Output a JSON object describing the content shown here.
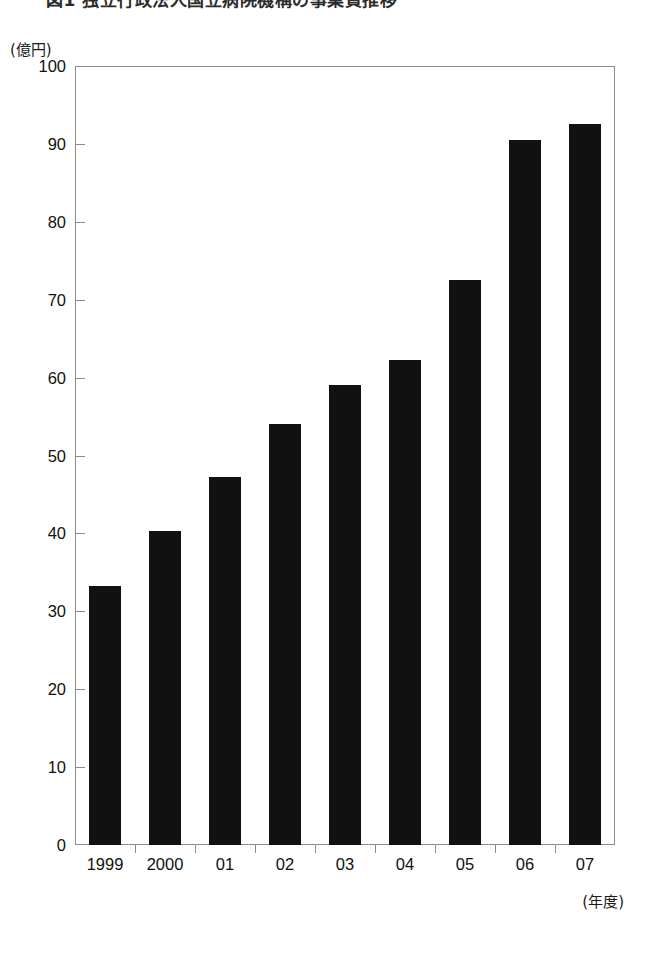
{
  "figure": {
    "title_cutoff": "図1 独立行政法人国立病院機構の事業費推移",
    "unit_label": "(億円)",
    "xaxis_caption": "(年度)"
  },
  "chart_data": {
    "type": "bar",
    "title": "",
    "xlabel": "(年度)",
    "ylabel": "(億円)",
    "ylim": [
      0,
      100
    ],
    "ytick_labels": [
      "100",
      "90",
      "80",
      "70",
      "60",
      "50",
      "40",
      "30",
      "20",
      "10",
      "0"
    ],
    "yticks": [
      100,
      90,
      80,
      70,
      60,
      50,
      40,
      30,
      20,
      10,
      0
    ],
    "grid": false,
    "legend": null,
    "categories": [
      "1999",
      "2000",
      "01",
      "02",
      "03",
      "04",
      "05",
      "06",
      "07"
    ],
    "values": [
      33.2,
      40.3,
      47.3,
      54.0,
      59.0,
      62.3,
      72.5,
      90.5,
      92.5
    ],
    "bar_color": "#111111"
  },
  "colors": {
    "bar": "#111111",
    "frame": "#8d8d8d",
    "text": "#111111",
    "background": "#ffffff"
  }
}
